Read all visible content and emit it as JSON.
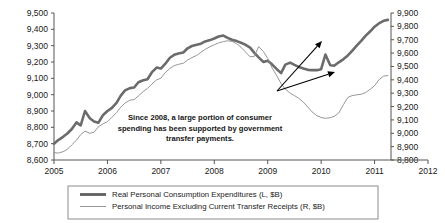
{
  "chart_data": {
    "type": "line",
    "title": "",
    "xlabel": "",
    "ylabel": "",
    "grid": false,
    "legend_position": "bottom",
    "x_axis": {
      "ticks": [
        2005,
        2006,
        2007,
        2008,
        2009,
        2010,
        2011,
        2012
      ],
      "tick_labels": [
        "2005",
        "2006",
        "2007",
        "2008",
        "2009",
        "2010",
        "2011",
        "2012"
      ],
      "xlim": [
        2005,
        2012
      ]
    },
    "y_axis_left": {
      "label": "Real Personal Consumption Expenditures (L, $B)",
      "tick_labels": [
        "9,500",
        "9,400",
        "9,300",
        "9,200",
        "9,100",
        "9,000",
        "8,900",
        "8,800",
        "8,700",
        "8,600"
      ],
      "ticks": [
        9500,
        9400,
        9300,
        9200,
        9100,
        9000,
        8900,
        8800,
        8700,
        8600
      ],
      "ylim": [
        8600,
        9500
      ]
    },
    "y_axis_right": {
      "label": "Personal Income Excluding Current Transfer Receipts (R, $B)",
      "tick_labels": [
        "9,900",
        "9,800",
        "9,700",
        "9,600",
        "9,500",
        "9,400",
        "9,300",
        "9,200",
        "9,100",
        "9,000",
        "8,900",
        "8,800"
      ],
      "ticks": [
        9900,
        9800,
        9700,
        9600,
        9500,
        9400,
        9300,
        9200,
        9100,
        9000,
        8900,
        8800
      ],
      "ylim": [
        8800,
        9900
      ]
    },
    "series": [
      {
        "name": "Real Personal Consumption Expenditures (L, $B)",
        "axis": "left",
        "style": "thick",
        "color": "#6b6b6b",
        "x": [
          2005.0,
          2005.08,
          2005.17,
          2005.25,
          2005.33,
          2005.42,
          2005.5,
          2005.58,
          2005.67,
          2005.75,
          2005.83,
          2005.92,
          2006.0,
          2006.08,
          2006.17,
          2006.25,
          2006.33,
          2006.42,
          2006.5,
          2006.58,
          2006.67,
          2006.75,
          2006.83,
          2006.92,
          2007.0,
          2007.08,
          2007.17,
          2007.25,
          2007.33,
          2007.42,
          2007.5,
          2007.58,
          2007.67,
          2007.75,
          2007.83,
          2007.92,
          2008.0,
          2008.08,
          2008.17,
          2008.25,
          2008.33,
          2008.42,
          2008.5,
          2008.58,
          2008.67,
          2008.75,
          2008.83,
          2008.92,
          2009.0,
          2009.08,
          2009.17,
          2009.25,
          2009.33,
          2009.42,
          2009.5,
          2009.58,
          2009.67,
          2009.75,
          2009.83,
          2009.92,
          2010.0,
          2010.08,
          2010.17,
          2010.25,
          2010.33,
          2010.42,
          2010.5,
          2010.58,
          2010.67,
          2010.75,
          2010.83,
          2010.92,
          2011.0,
          2011.08,
          2011.17,
          2011.25
        ],
        "values": [
          8700,
          8722,
          8742,
          8762,
          8788,
          8830,
          8812,
          8900,
          8856,
          8836,
          8828,
          8876,
          8900,
          8918,
          8950,
          8994,
          9026,
          9040,
          9044,
          9076,
          9088,
          9094,
          9136,
          9166,
          9160,
          9188,
          9226,
          9244,
          9252,
          9258,
          9284,
          9298,
          9306,
          9312,
          9326,
          9334,
          9344,
          9356,
          9362,
          9348,
          9336,
          9328,
          9318,
          9306,
          9288,
          9256,
          9228,
          9200,
          9208,
          9186,
          9156,
          9132,
          9184,
          9196,
          9182,
          9170,
          9160,
          9152,
          9150,
          9150,
          9156,
          9246,
          9180,
          9178,
          9198,
          9218,
          9240,
          9268,
          9302,
          9330,
          9360,
          9388,
          9416,
          9436,
          9452,
          9458
        ]
      },
      {
        "name": "Personal Income Excluding Current Transfer Receipts (R, $B)",
        "axis": "right",
        "style": "thin",
        "color": "#8a8a8a",
        "x": [
          2005.0,
          2005.08,
          2005.17,
          2005.25,
          2005.33,
          2005.42,
          2005.5,
          2005.58,
          2005.67,
          2005.75,
          2005.83,
          2005.92,
          2006.0,
          2006.08,
          2006.17,
          2006.25,
          2006.33,
          2006.42,
          2006.5,
          2006.58,
          2006.67,
          2006.75,
          2006.83,
          2006.92,
          2007.0,
          2007.08,
          2007.17,
          2007.25,
          2007.33,
          2007.42,
          2007.5,
          2007.58,
          2007.67,
          2007.75,
          2007.83,
          2007.92,
          2008.0,
          2008.08,
          2008.17,
          2008.25,
          2008.33,
          2008.42,
          2008.5,
          2008.58,
          2008.67,
          2008.75,
          2008.83,
          2008.92,
          2009.0,
          2009.08,
          2009.17,
          2009.25,
          2009.33,
          2009.42,
          2009.5,
          2009.58,
          2009.67,
          2009.75,
          2009.83,
          2009.92,
          2010.0,
          2010.08,
          2010.17,
          2010.25,
          2010.33,
          2010.42,
          2010.5,
          2010.58,
          2010.67,
          2010.75,
          2010.83,
          2010.92,
          2011.0,
          2011.08,
          2011.17,
          2011.25
        ],
        "values": [
          8855,
          8852,
          8862,
          8880,
          8912,
          8948,
          8990,
          9016,
          9000,
          9008,
          9048,
          9072,
          9086,
          9118,
          9154,
          9196,
          9226,
          9248,
          9252,
          9280,
          9312,
          9336,
          9368,
          9400,
          9412,
          9452,
          9486,
          9506,
          9516,
          9524,
          9548,
          9566,
          9582,
          9606,
          9628,
          9648,
          9662,
          9676,
          9686,
          9692,
          9688,
          9670,
          9644,
          9610,
          9572,
          9576,
          9648,
          9612,
          9560,
          9490,
          9430,
          9372,
          9330,
          9300,
          9282,
          9262,
          9232,
          9196,
          9160,
          9132,
          9118,
          9112,
          9116,
          9128,
          9152,
          9216,
          9268,
          9282,
          9288,
          9292,
          9304,
          9330,
          9356,
          9400,
          9428,
          9432
        ]
      }
    ],
    "annotations": [
      {
        "name": "transfer-payments-note",
        "lines": [
          "Since 2008, a large portion of consumer",
          "spending has been supported by government",
          "transfer payments."
        ]
      }
    ],
    "arrows": [
      {
        "name": "arrow-to-pce",
        "x1": 277,
        "y1": 91,
        "x2": 322,
        "y2": 41
      },
      {
        "name": "arrow-to-income",
        "x1": 277,
        "y1": 91,
        "x2": 335,
        "y2": 72
      }
    ],
    "legend": {
      "entries": [
        {
          "label": "Real Personal Consumption Expenditures (L, $B)",
          "style": "thick",
          "color": "#6b6b6b"
        },
        {
          "label": "Personal Income Excluding Current Transfer Receipts (R, $B)",
          "style": "thin",
          "color": "#8a8a8a"
        }
      ]
    }
  }
}
